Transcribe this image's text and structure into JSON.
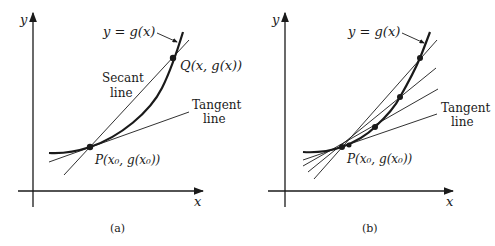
{
  "figure": {
    "panels": [
      {
        "id": "a",
        "caption": "(a)",
        "axis_x_label": "x",
        "axis_y_label": "y",
        "curve_label": "y = g(x)",
        "point_p_label": "P(x₀, g(x₀))",
        "point_q_label": "Q(x, g(x))",
        "secant_label_line1": "Secant",
        "secant_label_line2": "line",
        "tangent_label_line1": "Tangent",
        "tangent_label_line2": "line"
      },
      {
        "id": "b",
        "caption": "(b)",
        "axis_x_label": "x",
        "axis_y_label": "y",
        "curve_label": "y = g(x)",
        "point_p_label": "P(x₀, g(x₀))",
        "tangent_label_line1": "Tangent",
        "tangent_label_line2": "line"
      }
    ],
    "colors": {
      "ink": "#1a1a1a",
      "background": "#ffffff"
    }
  }
}
